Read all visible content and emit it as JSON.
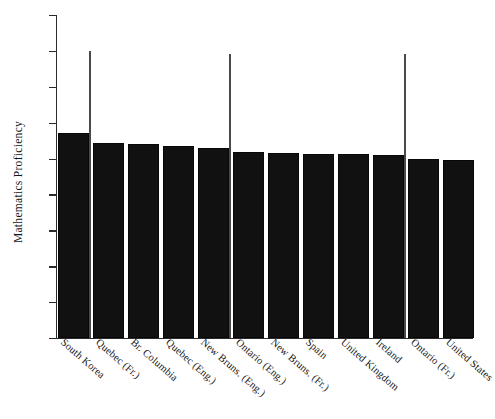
{
  "chart_data": {
    "type": "bar",
    "title": "",
    "xlabel": "",
    "ylabel": "Mathematics Proficiency",
    "ylim": [
      0,
      900
    ],
    "yticks": [
      0,
      100,
      200,
      300,
      400,
      500,
      600,
      700,
      800,
      900
    ],
    "ytick_labels": [
      "0",
      "100",
      "200",
      "300",
      "400",
      "500",
      "600",
      "700",
      "800",
      "900"
    ],
    "grid": false,
    "legend": null,
    "bar_color": "#111111",
    "axis_color": "#2b2b2b",
    "reference_line_color": "#4a4a4a",
    "categories": [
      "South Korea",
      "Quebec (Fr.)",
      "Br. Columbia",
      "Quebec (Eng.)",
      "New Bruns. (Eng.)",
      "Ontario (Eng.)",
      "New Bruns. (Fr.)",
      "Spain",
      "United Kingdom",
      "Ireland",
      "Ontario (Fr.)",
      "United States"
    ],
    "values": [
      570,
      543,
      541,
      536,
      530,
      517,
      515,
      513,
      512,
      509,
      500,
      495
    ],
    "reference_lines": [
      {
        "after_category": "South Korea",
        "value": 800
      },
      {
        "after_category": "New Bruns. (Eng.)",
        "value": 790
      },
      {
        "after_category": "Ireland",
        "value": 790
      }
    ]
  }
}
